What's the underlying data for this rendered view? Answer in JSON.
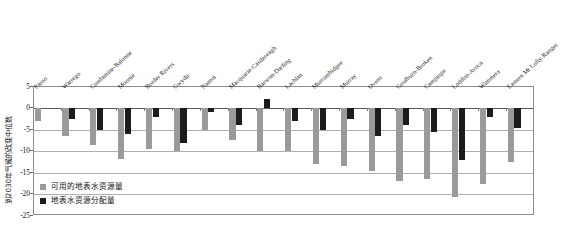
{
  "chart_data": {
    "type": "bar",
    "title": "",
    "xlabel": "",
    "ylabel": "到2030年气候的改变中位数",
    "ylim": [
      -25,
      5
    ],
    "yticks": [
      5,
      0,
      -5,
      -10,
      -15,
      -20,
      -25
    ],
    "ytick_labels": [
      "5",
      "0",
      "-5",
      "-10",
      "-15",
      "-20",
      "-25"
    ],
    "grid": true,
    "legend_position": "inside-lower-left",
    "categories": [
      "Paroo",
      "Warrego",
      "Condamine-Balonne",
      "Moonie",
      "Border Rivers",
      "Gwydir",
      "Namoi",
      "Macquarie-Castlereagh",
      "Barwon-Darling",
      "Lachlan",
      "Murrumbidgee",
      "Murray",
      "Ovens",
      "Goulburn-Broken",
      "Campaspe",
      "Loddon-Avoca",
      "Wimmera",
      "Eastern Mt Lofty Ranges"
    ],
    "series": [
      {
        "name": "可用的地表水资源量",
        "color": "#9a9a9a",
        "values": [
          -3.0,
          -6.5,
          -8.5,
          -11.8,
          -9.5,
          -10.0,
          -5.0,
          -7.5,
          -10.0,
          -10.0,
          -13.0,
          -13.5,
          -14.5,
          -17.0,
          -16.5,
          -20.5,
          -17.5,
          -12.5
        ]
      },
      {
        "name": "地表水资源分配量",
        "color": "#1c1c1c",
        "values": [
          0.0,
          -2.5,
          -5.0,
          -6.0,
          -2.0,
          -8.0,
          -1.0,
          -4.0,
          2.0,
          -3.0,
          -5.0,
          -2.5,
          -6.5,
          -4.0,
          -5.5,
          -12.0,
          -2.0,
          -4.5
        ]
      }
    ]
  },
  "legend": {
    "items": [
      {
        "label": "可用的地表水资源量",
        "color": "#9a9a9a"
      },
      {
        "label": "地表水资源分配量",
        "color": "#1c1c1c"
      }
    ]
  }
}
